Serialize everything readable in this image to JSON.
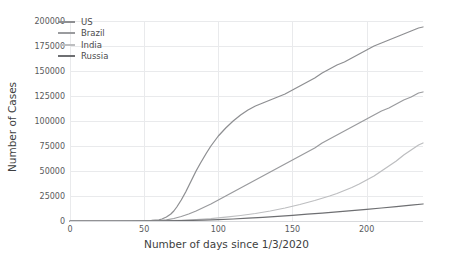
{
  "chart_data": {
    "type": "line",
    "title": "",
    "xlabel": "Number of days since 1/3/2020",
    "ylabel": "Number of Cases",
    "xlim": [
      0,
      238
    ],
    "ylim": [
      0,
      200000
    ],
    "xticks": [
      0,
      50,
      100,
      150,
      200
    ],
    "xtick_labels": [
      "0",
      "50",
      "100",
      "150",
      "200"
    ],
    "yticks": [
      0,
      25000,
      50000,
      75000,
      100000,
      125000,
      150000,
      175000,
      200000
    ],
    "ytick_labels": [
      "0",
      "25000",
      "50000",
      "75000",
      "100000",
      "125000",
      "150000",
      "175000",
      "200000"
    ],
    "grid": true,
    "legend_position": "upper left",
    "series": [
      {
        "name": "US",
        "color": "#8e8f92",
        "x": [
          0,
          10,
          20,
          30,
          40,
          50,
          55,
          60,
          62,
          65,
          68,
          70,
          72,
          75,
          78,
          80,
          82,
          85,
          88,
          90,
          92,
          95,
          98,
          100,
          105,
          110,
          115,
          120,
          125,
          130,
          135,
          140,
          145,
          150,
          155,
          160,
          165,
          170,
          175,
          180,
          185,
          190,
          195,
          200,
          205,
          210,
          215,
          220,
          225,
          230,
          235,
          238
        ],
        "values": [
          0,
          0,
          0,
          0,
          100,
          300,
          600,
          1200,
          2000,
          4000,
          7000,
          10000,
          14000,
          21000,
          29000,
          35000,
          41000,
          50000,
          58000,
          63000,
          68000,
          75000,
          81000,
          85000,
          93000,
          100000,
          106000,
          111000,
          115000,
          118000,
          121000,
          124000,
          127000,
          131000,
          135000,
          139000,
          143000,
          148000,
          152000,
          156000,
          159000,
          163000,
          167000,
          171000,
          175000,
          178000,
          181000,
          184000,
          187000,
          190000,
          193000,
          194000
        ]
      },
      {
        "name": "Brazil",
        "color": "#9a9b9e",
        "x": [
          0,
          20,
          40,
          55,
          60,
          65,
          70,
          75,
          80,
          85,
          90,
          95,
          100,
          105,
          110,
          115,
          120,
          125,
          130,
          135,
          140,
          145,
          150,
          155,
          160,
          165,
          170,
          175,
          180,
          185,
          190,
          195,
          200,
          205,
          210,
          215,
          220,
          225,
          230,
          235,
          238
        ],
        "values": [
          0,
          0,
          0,
          200,
          500,
          1200,
          2500,
          4500,
          7000,
          10000,
          13500,
          17000,
          21000,
          25000,
          29000,
          33000,
          37000,
          41000,
          45000,
          49000,
          53000,
          57000,
          61000,
          65000,
          69000,
          73000,
          78000,
          82000,
          86000,
          90000,
          94000,
          98000,
          102000,
          106000,
          110000,
          113000,
          117000,
          121000,
          124000,
          128000,
          129000
        ]
      },
      {
        "name": "India",
        "color": "#bdbec0",
        "x": [
          0,
          30,
          55,
          65,
          75,
          85,
          95,
          105,
          115,
          125,
          135,
          145,
          155,
          165,
          175,
          180,
          185,
          190,
          195,
          200,
          205,
          210,
          215,
          220,
          225,
          230,
          235,
          238
        ],
        "values": [
          0,
          0,
          100,
          300,
          700,
          1400,
          2400,
          3800,
          5500,
          7500,
          10000,
          13000,
          16500,
          20500,
          25000,
          27500,
          30500,
          33500,
          37000,
          41000,
          45000,
          50000,
          55000,
          60000,
          66000,
          71000,
          76000,
          78000
        ]
      },
      {
        "name": "Russia",
        "color": "#6e6f72",
        "x": [
          0,
          40,
          60,
          75,
          90,
          100,
          110,
          120,
          130,
          140,
          150,
          160,
          170,
          180,
          190,
          200,
          210,
          220,
          230,
          238
        ],
        "values": [
          0,
          0,
          100,
          400,
          900,
          1400,
          2000,
          2800,
          3700,
          4700,
          5700,
          6800,
          7900,
          9100,
          10300,
          11600,
          13000,
          14400,
          15900,
          17000
        ]
      }
    ]
  },
  "legend": {
    "items": [
      {
        "label": "US"
      },
      {
        "label": "Brazil"
      },
      {
        "label": "India"
      },
      {
        "label": "Russia"
      }
    ]
  }
}
